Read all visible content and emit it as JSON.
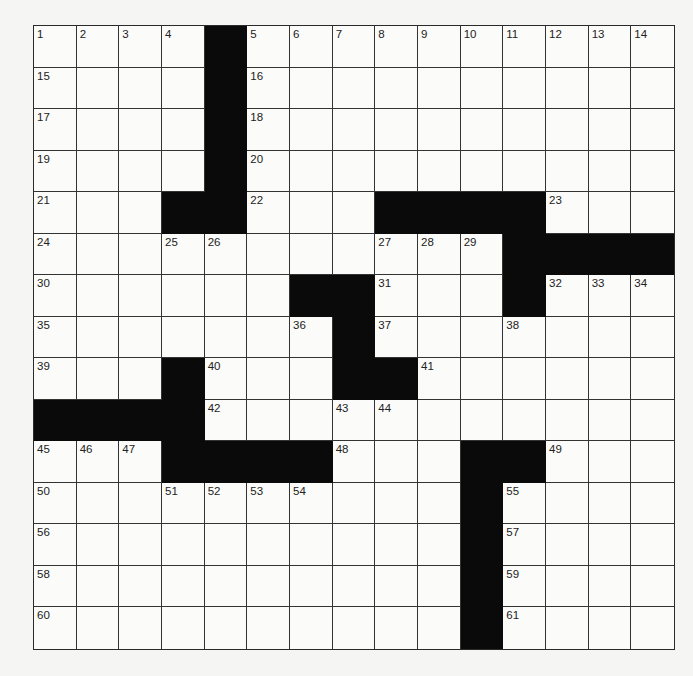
{
  "puzzle": {
    "size": {
      "rows": 15,
      "cols": 15
    },
    "colors": {
      "black": "#0a0a0a",
      "white": "#fbfbf9",
      "line": "#333333"
    },
    "layout": [
      "....#..........",
      "....#..........",
      "....#..........",
      "....#..........",
      "...##...####...",
      "...........####",
      "......##...#...",
      ".......#.......",
      "...#...##......",
      "####...........",
      "...####...##...",
      "..........#....",
      "..........#....",
      "..........#....",
      "..........#...."
    ],
    "numbers": [
      {
        "r": 0,
        "c": 0,
        "n": "1"
      },
      {
        "r": 0,
        "c": 1,
        "n": "2"
      },
      {
        "r": 0,
        "c": 2,
        "n": "3"
      },
      {
        "r": 0,
        "c": 3,
        "n": "4"
      },
      {
        "r": 0,
        "c": 5,
        "n": "5"
      },
      {
        "r": 0,
        "c": 6,
        "n": "6"
      },
      {
        "r": 0,
        "c": 7,
        "n": "7"
      },
      {
        "r": 0,
        "c": 8,
        "n": "8"
      },
      {
        "r": 0,
        "c": 9,
        "n": "9"
      },
      {
        "r": 0,
        "c": 10,
        "n": "10"
      },
      {
        "r": 0,
        "c": 11,
        "n": "11"
      },
      {
        "r": 0,
        "c": 12,
        "n": "12"
      },
      {
        "r": 0,
        "c": 13,
        "n": "13"
      },
      {
        "r": 0,
        "c": 14,
        "n": "14"
      },
      {
        "r": 1,
        "c": 0,
        "n": "15"
      },
      {
        "r": 1,
        "c": 5,
        "n": "16"
      },
      {
        "r": 2,
        "c": 0,
        "n": "17"
      },
      {
        "r": 2,
        "c": 5,
        "n": "18"
      },
      {
        "r": 3,
        "c": 0,
        "n": "19"
      },
      {
        "r": 3,
        "c": 5,
        "n": "20"
      },
      {
        "r": 4,
        "c": 0,
        "n": "21"
      },
      {
        "r": 4,
        "c": 5,
        "n": "22"
      },
      {
        "r": 4,
        "c": 12,
        "n": "23"
      },
      {
        "r": 5,
        "c": 0,
        "n": "24"
      },
      {
        "r": 5,
        "c": 3,
        "n": "25"
      },
      {
        "r": 5,
        "c": 4,
        "n": "26"
      },
      {
        "r": 5,
        "c": 8,
        "n": "27"
      },
      {
        "r": 5,
        "c": 9,
        "n": "28"
      },
      {
        "r": 5,
        "c": 10,
        "n": "29"
      },
      {
        "r": 6,
        "c": 0,
        "n": "30"
      },
      {
        "r": 6,
        "c": 8,
        "n": "31"
      },
      {
        "r": 6,
        "c": 12,
        "n": "32"
      },
      {
        "r": 6,
        "c": 13,
        "n": "33"
      },
      {
        "r": 6,
        "c": 14,
        "n": "34"
      },
      {
        "r": 7,
        "c": 0,
        "n": "35"
      },
      {
        "r": 7,
        "c": 6,
        "n": "36"
      },
      {
        "r": 7,
        "c": 8,
        "n": "37"
      },
      {
        "r": 7,
        "c": 11,
        "n": "38"
      },
      {
        "r": 8,
        "c": 0,
        "n": "39"
      },
      {
        "r": 8,
        "c": 4,
        "n": "40"
      },
      {
        "r": 8,
        "c": 9,
        "n": "41"
      },
      {
        "r": 9,
        "c": 4,
        "n": "42"
      },
      {
        "r": 9,
        "c": 7,
        "n": "43"
      },
      {
        "r": 9,
        "c": 8,
        "n": "44"
      },
      {
        "r": 10,
        "c": 0,
        "n": "45"
      },
      {
        "r": 10,
        "c": 1,
        "n": "46"
      },
      {
        "r": 10,
        "c": 2,
        "n": "47"
      },
      {
        "r": 10,
        "c": 7,
        "n": "48"
      },
      {
        "r": 10,
        "c": 12,
        "n": "49"
      },
      {
        "r": 11,
        "c": 0,
        "n": "50"
      },
      {
        "r": 11,
        "c": 3,
        "n": "51"
      },
      {
        "r": 11,
        "c": 4,
        "n": "52"
      },
      {
        "r": 11,
        "c": 5,
        "n": "53"
      },
      {
        "r": 11,
        "c": 6,
        "n": "54"
      },
      {
        "r": 11,
        "c": 11,
        "n": "55"
      },
      {
        "r": 12,
        "c": 0,
        "n": "56"
      },
      {
        "r": 12,
        "c": 11,
        "n": "57"
      },
      {
        "r": 13,
        "c": 0,
        "n": "58"
      },
      {
        "r": 13,
        "c": 11,
        "n": "59"
      },
      {
        "r": 14,
        "c": 0,
        "n": "60"
      },
      {
        "r": 14,
        "c": 11,
        "n": "61"
      }
    ]
  }
}
